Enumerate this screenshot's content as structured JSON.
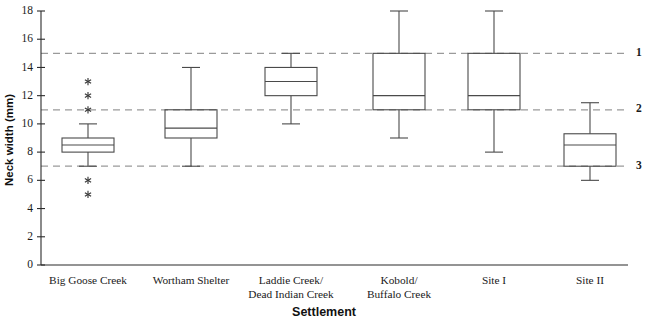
{
  "chart_data": {
    "type": "box",
    "title": "",
    "xlabel": "Settlement",
    "ylabel": "Neck width (mm)",
    "ylim": [
      0,
      18
    ],
    "ytick_step": 2,
    "yticks": [
      0,
      2,
      4,
      6,
      8,
      10,
      12,
      14,
      16,
      18
    ],
    "ytick_labels": [
      "0",
      "2",
      "4",
      "6",
      "8",
      "10",
      "12",
      "14",
      "16",
      "18"
    ],
    "grid": false,
    "legend": "none",
    "categories": [
      "Big Goose Creek",
      "Wortham Shelter",
      "Laddie Creek/\nDead Indian Creek",
      "Kobold/\nBuffalo Creek",
      "Site I",
      "Site II"
    ],
    "category_lines": [
      [
        "Big Goose Creek"
      ],
      [
        "Wortham Shelter"
      ],
      [
        "Laddie Creek/",
        "Dead Indian Creek"
      ],
      [
        "Kobold/",
        "Buffalo Creek"
      ],
      [
        "Site I"
      ],
      [
        "Site II"
      ]
    ],
    "boxes": [
      {
        "name": "Big Goose Creek",
        "whisker_low": 7.0,
        "q1": 8.0,
        "median": 8.5,
        "q3": 9.0,
        "whisker_high": 10.0,
        "outliers": [
          5.0,
          6.0,
          11.0,
          12.0,
          13.0
        ]
      },
      {
        "name": "Wortham Shelter",
        "whisker_low": 7.0,
        "q1": 9.0,
        "median": 9.7,
        "q3": 11.0,
        "whisker_high": 14.0,
        "outliers": []
      },
      {
        "name": "Laddie Creek/Dead Indian Creek",
        "whisker_low": 10.0,
        "q1": 12.0,
        "median": 13.0,
        "q3": 14.0,
        "whisker_high": 15.0,
        "outliers": []
      },
      {
        "name": "Kobold/Buffalo Creek",
        "whisker_low": 9.0,
        "q1": 11.0,
        "median": 12.0,
        "q3": 15.0,
        "whisker_high": 18.0,
        "outliers": []
      },
      {
        "name": "Site I",
        "whisker_low": 8.0,
        "q1": 11.0,
        "median": 12.0,
        "q3": 15.0,
        "whisker_high": 18.0,
        "outliers": []
      },
      {
        "name": "Site II",
        "whisker_low": 6.0,
        "q1": 7.0,
        "median": 8.5,
        "q3": 9.3,
        "whisker_high": 11.5,
        "outliers": []
      }
    ],
    "reference_lines": [
      {
        "value": 15.0,
        "label": "1"
      },
      {
        "value": 11.0,
        "label": "2"
      },
      {
        "value": 7.0,
        "label": "3"
      }
    ],
    "colors": {
      "axis": "#2b2b2b",
      "box_stroke": "#4a4a4a",
      "reference_line": "#9a9a9a",
      "outlier": "#3a3a3a",
      "background": "#ffffff",
      "text": "#1a1a1a"
    }
  }
}
